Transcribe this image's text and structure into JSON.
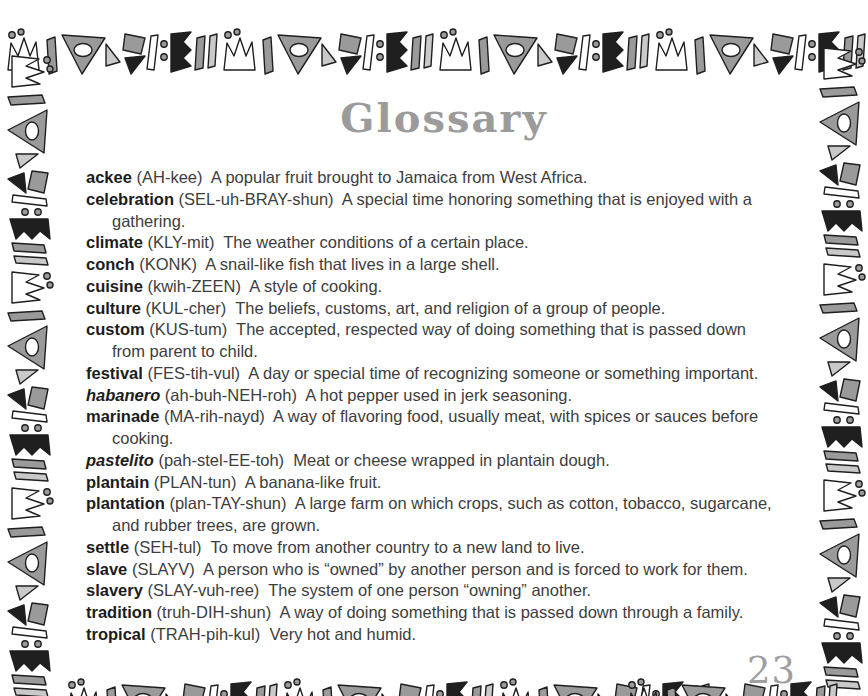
{
  "page": {
    "title": "Glossary",
    "page_number": "23"
  },
  "decoration": {
    "border_style": "hand-drawn geometric shapes (crowns, triangles with oval holes, slanted bars, zigzag flags, dots)",
    "colors": {
      "black": "#1f1f1f",
      "gray": "#9a9a9a",
      "light_gray": "#c9c9c9",
      "white": "#ffffff",
      "title_gray": "#9b9b9b",
      "text": "#3d3d3d"
    }
  },
  "glossary": {
    "entries": [
      {
        "term": "ackee",
        "italic": false,
        "pronunciation": "(AH-kee)",
        "definition": "A popular fruit brought to Jamaica from West Africa."
      },
      {
        "term": "celebration",
        "italic": false,
        "pronunciation": "(SEL-uh-BRAY-shun)",
        "definition": "A special time honoring something that is enjoyed with a\ngathering."
      },
      {
        "term": "climate",
        "italic": false,
        "pronunciation": "(KLY-mit)",
        "definition": "The weather conditions of a certain place."
      },
      {
        "term": "conch",
        "italic": false,
        "pronunciation": "(KONK)",
        "definition": "A snail-like fish that lives in a large shell."
      },
      {
        "term": "cuisine",
        "italic": false,
        "pronunciation": "(kwih-ZEEN)",
        "definition": "A style of cooking."
      },
      {
        "term": "culture",
        "italic": false,
        "pronunciation": "(KUL-cher)",
        "definition": "The beliefs, customs, art, and religion of a group of people."
      },
      {
        "term": "custom",
        "italic": false,
        "pronunciation": "(KUS-tum)",
        "definition": "The accepted, respected way of doing something that is passed down\nfrom parent to child."
      },
      {
        "term": "festival",
        "italic": false,
        "pronunciation": "(FES-tih-vul)",
        "definition": "A day or special time of recognizing someone or something important."
      },
      {
        "term": "habanero",
        "italic": true,
        "pronunciation": "(ah-buh-NEH-roh)",
        "definition": "A hot pepper used in jerk seasoning."
      },
      {
        "term": "marinade",
        "italic": false,
        "pronunciation": "(MA-rih-nayd)",
        "definition": "A way of flavoring food, usually meat, with spices or sauces before\ncooking."
      },
      {
        "term": "pastelito",
        "italic": true,
        "pronunciation": "(pah-stel-EE-toh)",
        "definition": "Meat or cheese wrapped in plantain dough."
      },
      {
        "term": "plantain",
        "italic": false,
        "pronunciation": "(PLAN-tun)",
        "definition": "A banana-like fruit."
      },
      {
        "term": "plantation",
        "italic": false,
        "pronunciation": "(plan-TAY-shun)",
        "definition": "A large farm on which crops, such as cotton, tobacco, sugarcane,\nand rubber trees, are grown."
      },
      {
        "term": "settle",
        "italic": false,
        "pronunciation": "(SEH-tul)",
        "definition": "To move from another country to a new land to live."
      },
      {
        "term": "slave",
        "italic": false,
        "pronunciation": "(SLAYV)",
        "definition": "A person who is “owned” by another person and is forced to work for them."
      },
      {
        "term": "slavery",
        "italic": false,
        "pronunciation": "(SLAY-vuh-ree)",
        "definition": "The system of one person “owning” another."
      },
      {
        "term": "tradition",
        "italic": false,
        "pronunciation": "(truh-DIH-shun)",
        "definition": "A way of doing something that is passed down through a family."
      },
      {
        "term": "tropical",
        "italic": false,
        "pronunciation": "(TRAH-pih-kul)",
        "definition": "Very hot and humid."
      }
    ]
  }
}
